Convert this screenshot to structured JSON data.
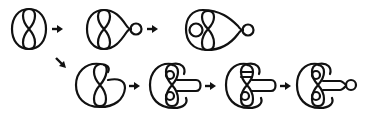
{
  "diagram": {
    "stroke_color": "#111111",
    "background_color": "#ffffff",
    "rows": [
      {
        "row": 1,
        "figures": [
          {
            "id": "fig1",
            "shape": "oval-with-figure-eight"
          },
          {
            "id": "fig2",
            "shape": "oval-with-figure-eight-and-side-loop"
          },
          {
            "id": "fig3",
            "shape": "oval-with-three-lobes-and-side-loop"
          }
        ],
        "arrows": [
          {
            "from": "fig1",
            "to": "fig2",
            "direction": "right"
          },
          {
            "from": "fig2",
            "to": "fig3",
            "direction": "right"
          }
        ]
      },
      {
        "row": 2,
        "figures": [
          {
            "id": "fig4",
            "shape": "open-c-with-figure-eight"
          },
          {
            "id": "fig5",
            "shape": "c-with-lobes-and-tongue"
          },
          {
            "id": "fig6",
            "shape": "c-with-twisted-lobes-and-tongue"
          },
          {
            "id": "fig7",
            "shape": "c-with-lobes-and-tongue-loop"
          }
        ],
        "arrows": [
          {
            "from": "fig1",
            "to": "fig4",
            "direction": "down-right"
          },
          {
            "from": "fig4",
            "to": "fig5",
            "direction": "right"
          },
          {
            "from": "fig5",
            "to": "fig6",
            "direction": "right"
          },
          {
            "from": "fig6",
            "to": "fig7",
            "direction": "right"
          }
        ]
      }
    ]
  }
}
